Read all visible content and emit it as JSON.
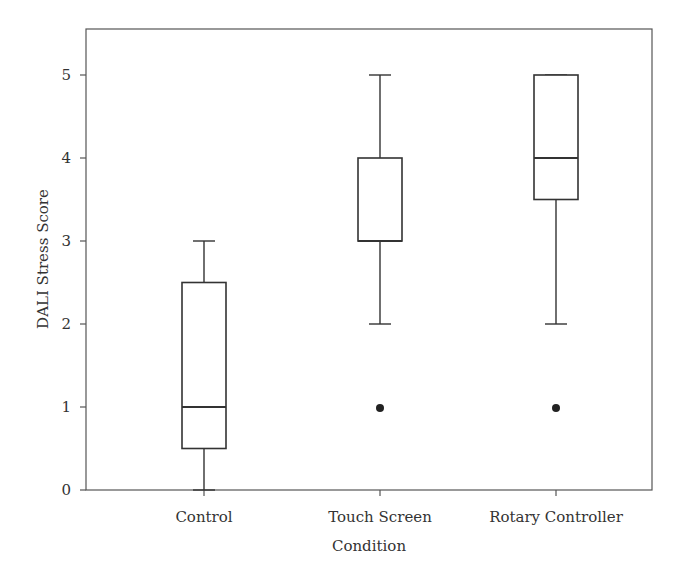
{
  "chart_data": {
    "type": "box",
    "title": "",
    "xlabel": "Condition",
    "ylabel": "DALI Stress Score",
    "ylim": [
      0,
      5.5
    ],
    "yticks": [
      0,
      1,
      2,
      3,
      4,
      5
    ],
    "grid": false,
    "legend": null,
    "categories": [
      "Control",
      "Touch Screen",
      "Rotary Controller"
    ],
    "series": [
      {
        "name": "Control",
        "whisker_low": 0,
        "q1": 0.5,
        "median": 1,
        "q3": 2.5,
        "whisker_high": 3,
        "outliers": []
      },
      {
        "name": "Touch Screen",
        "whisker_low": 2,
        "q1": 3,
        "median": 3,
        "q3": 4,
        "whisker_high": 5,
        "outliers": [
          1
        ]
      },
      {
        "name": "Rotary Controller",
        "whisker_low": 2,
        "q1": 3.5,
        "median": 4,
        "q3": 5,
        "whisker_high": 5,
        "outliers": [
          1
        ]
      }
    ]
  },
  "axes": {
    "y_title": "DALI Stress Score",
    "x_title": "Condition",
    "y_tick_labels": [
      "0",
      "1",
      "2",
      "3",
      "4",
      "5"
    ],
    "x_tick_labels": [
      "Control",
      "Touch Screen",
      "Rotary Controller"
    ]
  }
}
